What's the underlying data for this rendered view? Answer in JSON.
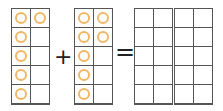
{
  "equation": {
    "operator_plus": "+",
    "operator_equals": "=",
    "frames": [
      {
        "name": "addend-1",
        "filled": [
          true,
          true,
          true,
          false,
          true,
          false,
          true,
          false,
          true,
          false
        ]
      },
      {
        "name": "addend-2",
        "filled": [
          true,
          true,
          true,
          true,
          true,
          false,
          true,
          false,
          true,
          false
        ]
      },
      {
        "name": "sum-frame-1",
        "filled": [
          false,
          false,
          false,
          false,
          false,
          false,
          false,
          false,
          false,
          false
        ]
      },
      {
        "name": "sum-frame-2",
        "filled": [
          false,
          false,
          false,
          false,
          false,
          false,
          false,
          false,
          false,
          false
        ]
      }
    ],
    "addend_1_count": 6,
    "addend_2_count": 7
  },
  "colors": {
    "counter": "#f2b766",
    "grid": "#555555"
  }
}
